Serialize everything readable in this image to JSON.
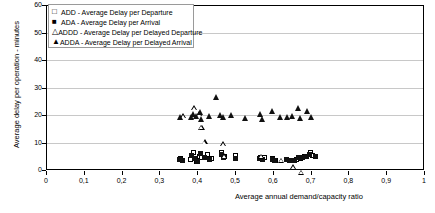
{
  "chart_data": {
    "type": "scatter",
    "title": "",
    "xlabel": "Average annual demand/capacity ratio",
    "ylabel": "Average delay per operation - minutes",
    "xlim": [
      0,
      1
    ],
    "ylim": [
      0,
      60
    ],
    "xticks": [
      "0",
      "0,1",
      "0,2",
      "0,3",
      "0,4",
      "0,5",
      "0,6",
      "0,7",
      "0,8",
      "0,9",
      "1"
    ],
    "xtick_values": [
      0,
      0.1,
      0.2,
      0.3,
      0.4,
      0.5,
      0.6,
      0.7,
      0.8,
      0.9,
      1.0
    ],
    "yticks": [
      "0",
      "10",
      "20",
      "30",
      "40",
      "50",
      "60"
    ],
    "ytick_values": [
      0,
      10,
      20,
      30,
      40,
      50,
      60
    ],
    "grid": true,
    "grid_axis": "y",
    "legend_position": "top-left",
    "series": [
      {
        "name": "ADD - Average Delay per Departure",
        "key": "ADD",
        "marker": "open-square",
        "points": [
          [
            0.355,
            4.2
          ],
          [
            0.362,
            3.6
          ],
          [
            0.383,
            4.0
          ],
          [
            0.39,
            6.5
          ],
          [
            0.397,
            3.1
          ],
          [
            0.405,
            5.0
          ],
          [
            0.412,
            4.4
          ],
          [
            0.427,
            5.6
          ],
          [
            0.437,
            4.3
          ],
          [
            0.465,
            6.3
          ],
          [
            0.472,
            4.9
          ],
          [
            0.5,
            5.1
          ],
          [
            0.567,
            4.5
          ],
          [
            0.578,
            4.4
          ],
          [
            0.6,
            4.1
          ],
          [
            0.608,
            3.3
          ],
          [
            0.637,
            4.0
          ],
          [
            0.648,
            3.4
          ],
          [
            0.662,
            3.9
          ],
          [
            0.672,
            4.2
          ],
          [
            0.683,
            5.0
          ],
          [
            0.7,
            6.3
          ],
          [
            0.706,
            5.2
          ]
        ]
      },
      {
        "name": "ADA - Average Delay per Arrival",
        "key": "ADA",
        "marker": "filled-square",
        "points": [
          [
            0.352,
            4.0
          ],
          [
            0.36,
            3.3
          ],
          [
            0.385,
            5.4
          ],
          [
            0.392,
            4.1
          ],
          [
            0.4,
            3.2
          ],
          [
            0.408,
            5.9
          ],
          [
            0.42,
            4.6
          ],
          [
            0.432,
            4.0
          ],
          [
            0.465,
            5.7
          ],
          [
            0.47,
            4.6
          ],
          [
            0.502,
            4.2
          ],
          [
            0.565,
            4.2
          ],
          [
            0.572,
            3.8
          ],
          [
            0.598,
            4.0
          ],
          [
            0.605,
            3.3
          ],
          [
            0.635,
            4.0
          ],
          [
            0.645,
            3.3
          ],
          [
            0.658,
            3.5
          ],
          [
            0.668,
            4.4
          ],
          [
            0.678,
            4.6
          ],
          [
            0.69,
            5.0
          ],
          [
            0.698,
            5.6
          ],
          [
            0.712,
            4.8
          ]
        ]
      },
      {
        "name": "ADDD - Average Delay per Delayed Departure",
        "key": "ADDD",
        "marker": "open-triangle",
        "points": [
          [
            0.362,
            19.6
          ],
          [
            0.392,
            24.2
          ],
          [
            0.405,
            23.9
          ],
          [
            0.41,
            20.6
          ],
          [
            0.412,
            22.6
          ],
          [
            0.42,
            19.2
          ],
          [
            0.468,
            20.3
          ],
          [
            0.472,
            17.8
          ],
          [
            0.57,
            19.4
          ],
          [
            0.622,
            19.7
          ],
          [
            0.655,
            19.1
          ],
          [
            0.676,
            19.0
          ]
        ]
      },
      {
        "name": "ADDA - Average Delay per Delayed Arrival",
        "key": "ADDA",
        "marker": "filled-triangle",
        "points": [
          [
            0.355,
            19.3
          ],
          [
            0.385,
            19.1
          ],
          [
            0.39,
            20.2
          ],
          [
            0.398,
            19.6
          ],
          [
            0.408,
            21.0
          ],
          [
            0.412,
            18.6
          ],
          [
            0.432,
            19.4
          ],
          [
            0.45,
            26.6
          ],
          [
            0.462,
            19.8
          ],
          [
            0.47,
            19.3
          ],
          [
            0.49,
            19.8
          ],
          [
            0.528,
            18.9
          ],
          [
            0.566,
            20.4
          ],
          [
            0.572,
            18.3
          ],
          [
            0.598,
            21.3
          ],
          [
            0.62,
            19.1
          ],
          [
            0.638,
            19.1
          ],
          [
            0.652,
            19.4
          ],
          [
            0.668,
            22.4
          ],
          [
            0.672,
            18.8
          ],
          [
            0.692,
            21.3
          ],
          [
            0.702,
            19.2
          ]
        ]
      }
    ]
  },
  "legend": {
    "items": [
      {
        "marker_glyph": "□",
        "label": "ADD - Average Delay per Departure"
      },
      {
        "marker_glyph": "■",
        "label": "ADA - Average Delay per Arrival"
      },
      {
        "marker_glyph": "△",
        "label": "ADDD - Average Delay per Delayed Departure"
      },
      {
        "marker_glyph": "▲",
        "label": "ADDA - Average Delay per Delayed Arrival"
      }
    ]
  },
  "colors": {
    "marker": "#111111",
    "grid": "#c8c8c8",
    "axis": "#000000",
    "background": "#ffffff"
  }
}
